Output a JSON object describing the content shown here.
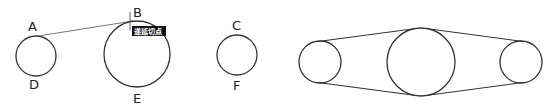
{
  "diagram": {
    "stroke_color": "#333333",
    "labels": {
      "A": "A",
      "B": "B",
      "C": "C",
      "D": "D",
      "E": "E",
      "F": "F"
    },
    "snap_tooltip": {
      "text": "递延切点",
      "background": "#111111"
    },
    "circles": [
      {
        "id": "circle-AD",
        "cx": 36,
        "cy": 56,
        "r": 20
      },
      {
        "id": "circle-BE",
        "cx": 137,
        "cy": 54,
        "r": 33
      },
      {
        "id": "circle-CF",
        "cx": 237,
        "cy": 55,
        "r": 20
      },
      {
        "id": "belt-left",
        "cx": 320,
        "cy": 62,
        "r": 21
      },
      {
        "id": "belt-middle",
        "cx": 421,
        "cy": 62,
        "r": 34
      },
      {
        "id": "belt-right",
        "cx": 521,
        "cy": 62,
        "r": 21
      }
    ]
  }
}
